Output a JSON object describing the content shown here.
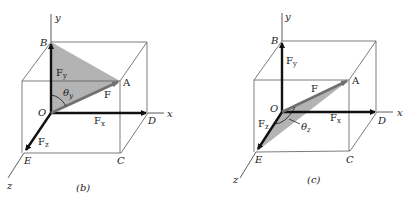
{
  "figure_b": {
    "caption": "(b)",
    "axes": {
      "x": "x",
      "y": "y",
      "z": "z"
    },
    "points": {
      "O": "O",
      "A": "A",
      "B": "B",
      "C": "C",
      "D": "D",
      "E": "E"
    },
    "vectors": {
      "F": "F",
      "Fx": "F",
      "Fx_sub": "x",
      "Fy": "F",
      "Fy_sub": "y",
      "Fz": "F",
      "Fz_sub": "z"
    },
    "angle": {
      "symbol": "θ",
      "sub": "y"
    },
    "shaded_plane": "O-B-A"
  },
  "figure_c": {
    "caption": "(c)",
    "axes": {
      "x": "x",
      "y": "y",
      "z": "z"
    },
    "points": {
      "O": "O",
      "A": "A",
      "B": "B",
      "C": "C",
      "D": "D",
      "E": "E"
    },
    "vectors": {
      "F": "F",
      "Fx": "F",
      "Fx_sub": "x",
      "Fy": "F",
      "Fy_sub": "y",
      "Fz": "F",
      "Fz_sub": "z"
    },
    "angle": {
      "symbol": "θ",
      "sub": "z"
    },
    "shaded_plane": "O-A-E"
  },
  "colors": {
    "shade": "#b3b3b3",
    "force": "#707070",
    "component": "#111111",
    "box": "#5a5a5a"
  }
}
